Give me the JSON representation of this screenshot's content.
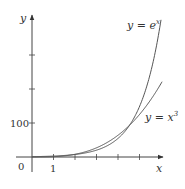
{
  "chart_data": {
    "type": "line",
    "title": "",
    "xlabel": "x",
    "ylabel": "y",
    "xlim": [
      0,
      6.1
    ],
    "ylim": [
      0,
      410
    ],
    "grid": false,
    "x_ticks": [
      1,
      2,
      3,
      4,
      5
    ],
    "x_tick_labels": [
      "1"
    ],
    "y_ticks": [
      100,
      200,
      300
    ],
    "y_tick_labels": [
      "100"
    ],
    "origin_label": "0",
    "series": [
      {
        "name": "y = e^x",
        "label_base": "y = e",
        "label_sup": "x",
        "function": "exp",
        "x": [
          0,
          1,
          2,
          3,
          4,
          5,
          6
        ],
        "values": [
          1,
          2.72,
          7.39,
          20.09,
          54.6,
          148.4,
          403.4
        ]
      },
      {
        "name": "y = x^3",
        "label_base": "y = x",
        "label_sup": "3",
        "function": "cube",
        "x": [
          0,
          1,
          2,
          3,
          4,
          5,
          6
        ],
        "values": [
          0,
          1,
          8,
          27,
          64,
          125,
          216
        ]
      }
    ],
    "annotations": [
      "y = e^x",
      "y = x^3"
    ],
    "legend": "none (inline curve labels)"
  },
  "colors": {
    "axis": "#444444",
    "curve": "#555555",
    "text": "#333333"
  }
}
